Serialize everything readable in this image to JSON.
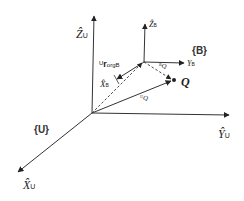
{
  "diagram": {
    "frames": {
      "universe": {
        "label": "{U}",
        "axes": {
          "z": {
            "base": "Ẑ",
            "subscript": "U"
          },
          "y": {
            "base": "Ŷ",
            "subscript": "U"
          },
          "x": {
            "base": "X̂",
            "subscript": "U"
          }
        }
      },
      "body": {
        "label": "{B}",
        "axes": {
          "z": {
            "base": "Ẑ",
            "subscript": "B"
          },
          "y": {
            "base": "Y",
            "subscript": "B"
          },
          "x": {
            "base": "X̂",
            "subscript": "B"
          }
        }
      }
    },
    "vectors": {
      "origin_offset": {
        "superscript": "U",
        "base": "r",
        "subscript": "orgB"
      },
      "q_in_u": {
        "superscript": "U",
        "base": "Q"
      },
      "q_in_b": {
        "superscript": "B",
        "base": "Q"
      }
    },
    "point": {
      "label": "Q"
    },
    "colors": {
      "line": "#333333",
      "text": "#222222",
      "background": "#ffffff"
    }
  }
}
